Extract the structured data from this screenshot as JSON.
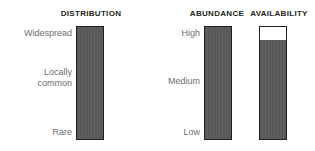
{
  "panels": [
    {
      "title": "DISTRIBUTION",
      "labels": {
        "top": "Widespread",
        "middle_line1": "Locally",
        "middle_line2": "common",
        "bottom": "Rare"
      }
    },
    {
      "title": "ABUNDANCE",
      "labels": {
        "top": "High",
        "middle": "Medium",
        "bottom": "Low"
      }
    },
    {
      "title": "AVAILABILITY"
    }
  ],
  "colors": {
    "bar_fill": "#58585a",
    "bar_outline": "#231f20",
    "bar_empty": "#ffffff",
    "label_text": "#6d6e71",
    "title_text": "#231f20",
    "background": "#ffffff"
  },
  "chart_data": {
    "type": "bar",
    "title": "",
    "xlabel": "",
    "ylabel": "",
    "orientation": "vertical",
    "grid": false,
    "legend": false,
    "ylim": [
      0,
      100
    ],
    "categories": [
      "DISTRIBUTION",
      "ABUNDANCE",
      "AVAILABILITY"
    ],
    "values": [
      100,
      100,
      88
    ],
    "series": [
      {
        "name": "Level",
        "values": [
          100,
          100,
          88
        ]
      }
    ],
    "tick_labels": {
      "DISTRIBUTION": [
        "Rare",
        "Locally common",
        "Widespread"
      ],
      "ABUNDANCE": [
        "Low",
        "Medium",
        "High"
      ],
      "AVAILABILITY": []
    },
    "annotations": [
      "DISTRIBUTION bar filled from Rare to Widespread (full)",
      "ABUNDANCE bar filled from Low to High (full)",
      "AVAILABILITY bar filled to approximately 88% with white gap at top"
    ]
  }
}
